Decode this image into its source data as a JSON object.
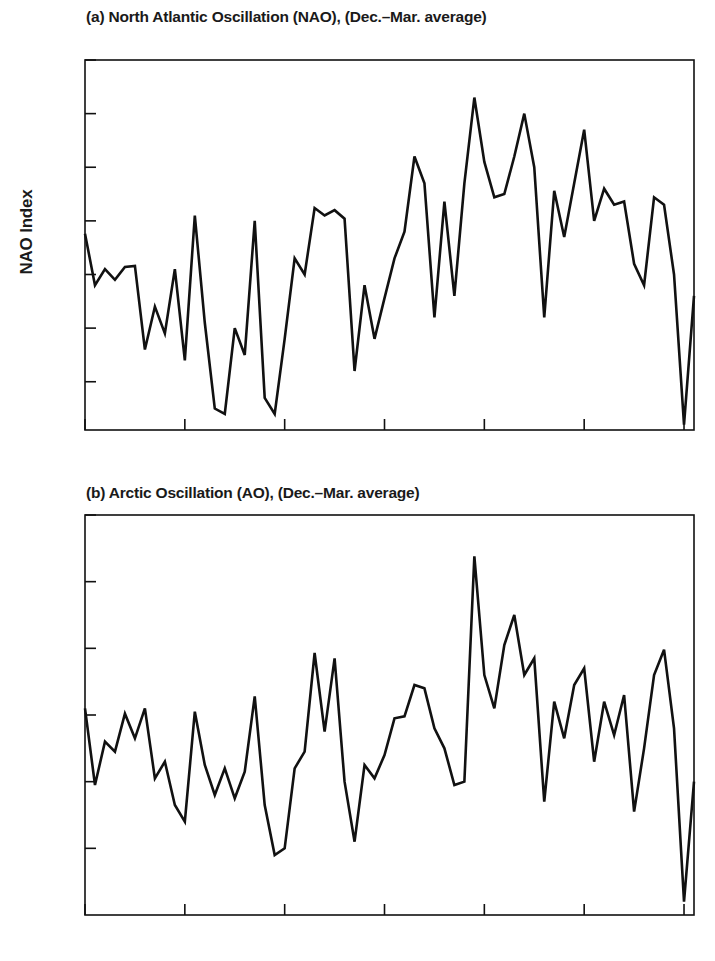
{
  "figure": {
    "background_color": "#ffffff",
    "line_color": "#111111"
  },
  "panels": [
    {
      "id": "a",
      "title": "(a) North Atlantic Oscillation (NAO), (Dec.–Mar. average)",
      "ylabel": "NAO Index",
      "yticks": [
        "1.5",
        "1.0",
        "0.5",
        "0",
        "−0.5",
        "−1.0",
        "−1.5"
      ],
      "xticks": [
        "1950",
        "1960",
        "1970",
        "1980",
        "1990",
        "2000",
        "2010"
      ]
    },
    {
      "id": "b",
      "title": "(b) Arctic Oscillation (AO), (Dec.–Mar. average)",
      "ylabel": "AO Index",
      "yticks": [
        "3",
        "2",
        "1",
        "0",
        "−1",
        "−2"
      ],
      "xticks": [
        "1950",
        "1960",
        "1970",
        "1980",
        "1990",
        "2000",
        "2010"
      ]
    }
  ],
  "chart_data": [
    {
      "type": "line",
      "title": "(a) North Atlantic Oscillation (NAO), (Dec.–Mar. average)",
      "xlabel": "",
      "ylabel": "NAO Index",
      "xlim": [
        1950,
        2011
      ],
      "ylim": [
        -1.95,
        1.5
      ],
      "yticks": [
        1.5,
        1.0,
        0.5,
        0,
        -0.5,
        -1.0,
        -1.5
      ],
      "xticks": [
        1950,
        1960,
        1970,
        1980,
        1990,
        2000,
        2010
      ],
      "grid": false,
      "legend": "none",
      "series": [
        {
          "name": "NAO Index",
          "color": "#111111",
          "x": [
            1950,
            1951,
            1952,
            1953,
            1954,
            1955,
            1956,
            1957,
            1958,
            1959,
            1960,
            1961,
            1962,
            1963,
            1964,
            1965,
            1966,
            1967,
            1968,
            1969,
            1970,
            1971,
            1972,
            1973,
            1974,
            1975,
            1976,
            1977,
            1978,
            1979,
            1980,
            1981,
            1982,
            1983,
            1984,
            1985,
            1986,
            1987,
            1988,
            1989,
            1990,
            1991,
            1992,
            1993,
            1994,
            1995,
            1996,
            1997,
            1998,
            1999,
            2000,
            2001,
            2002,
            2003,
            2004,
            2005,
            2006,
            2007,
            2008,
            2009,
            2010,
            2011
          ],
          "values": [
            -0.12,
            -0.6,
            -0.45,
            -0.55,
            -0.43,
            -0.42,
            -1.2,
            -0.8,
            -1.05,
            -0.45,
            -1.3,
            0.05,
            -0.95,
            -1.75,
            -1.8,
            -1.0,
            -1.25,
            0.0,
            -1.65,
            -1.8,
            -1.1,
            -0.35,
            -0.5,
            0.12,
            0.05,
            0.1,
            0.02,
            -1.4,
            -0.6,
            -1.1,
            -0.72,
            -0.35,
            -0.1,
            0.6,
            0.35,
            -0.9,
            0.18,
            -0.7,
            0.35,
            1.15,
            0.55,
            0.22,
            0.25,
            0.6,
            1.0,
            0.5,
            -0.9,
            0.28,
            -0.15,
            0.35,
            0.85,
            0.0,
            0.3,
            0.15,
            0.18,
            -0.4,
            -0.6,
            0.22,
            0.15,
            -0.5,
            -1.9,
            -0.7
          ]
        }
      ]
    },
    {
      "type": "line",
      "title": "(b) Arctic Oscillation (AO), (Dec.–Mar. average)",
      "xlabel": "",
      "ylabel": "AO Index",
      "xlim": [
        1950,
        2011
      ],
      "ylim": [
        -3.0,
        3.0
      ],
      "yticks": [
        3,
        2,
        1,
        0,
        -1,
        -2
      ],
      "xticks": [
        1950,
        1960,
        1970,
        1980,
        1990,
        2000,
        2010
      ],
      "grid": false,
      "legend": "none",
      "series": [
        {
          "name": "AO Index",
          "color": "#111111",
          "x": [
            1950,
            1951,
            1952,
            1953,
            1954,
            1955,
            1956,
            1957,
            1958,
            1959,
            1960,
            1961,
            1962,
            1963,
            1964,
            1965,
            1966,
            1967,
            1968,
            1969,
            1970,
            1971,
            1972,
            1973,
            1974,
            1975,
            1976,
            1977,
            1978,
            1979,
            1980,
            1981,
            1982,
            1983,
            1984,
            1985,
            1986,
            1987,
            1988,
            1989,
            1990,
            1991,
            1992,
            1993,
            1994,
            1995,
            1996,
            1997,
            1998,
            1999,
            2000,
            2001,
            2002,
            2003,
            2004,
            2005,
            2006,
            2007,
            2008,
            2009,
            2010,
            2011
          ],
          "values": [
            0.1,
            -1.05,
            -0.4,
            -0.55,
            0.02,
            -0.35,
            0.1,
            -0.95,
            -0.7,
            -1.35,
            -1.6,
            0.05,
            -0.75,
            -1.2,
            -0.8,
            -1.25,
            -0.85,
            0.28,
            -1.35,
            -2.1,
            -2.0,
            -0.8,
            -0.55,
            0.93,
            -0.25,
            0.85,
            -1.0,
            -1.9,
            -0.75,
            -0.95,
            -0.6,
            -0.05,
            -0.02,
            0.45,
            0.4,
            -0.2,
            -0.5,
            -1.05,
            -1.0,
            2.38,
            0.6,
            0.1,
            1.05,
            1.5,
            0.6,
            0.85,
            -1.3,
            0.2,
            -0.35,
            0.45,
            0.7,
            -0.7,
            0.2,
            -0.3,
            0.3,
            -1.45,
            -0.5,
            0.6,
            0.98,
            -0.2,
            -2.8,
            -1.0
          ]
        }
      ]
    }
  ]
}
